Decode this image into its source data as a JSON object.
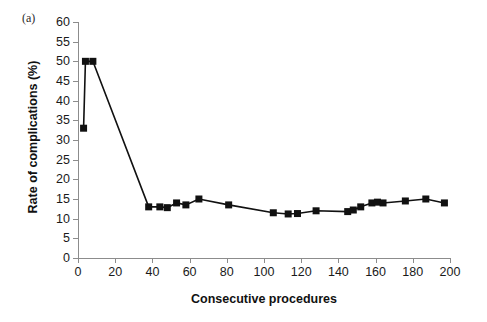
{
  "figure": {
    "panel_label": "(a)",
    "background_color": "#ffffff",
    "axis_color": "#8c8c8c",
    "series_color": "#111111"
  },
  "chart_data": {
    "type": "line",
    "title": "",
    "xlabel": "Consecutive procedures",
    "ylabel": "Rate of complications (%)",
    "xlim": [
      0,
      200
    ],
    "ylim": [
      0,
      60
    ],
    "xticks": [
      0,
      20,
      40,
      60,
      80,
      100,
      120,
      140,
      160,
      180,
      200
    ],
    "yticks": [
      0,
      5,
      10,
      15,
      20,
      25,
      30,
      35,
      40,
      45,
      50,
      55,
      60
    ],
    "xtick_labels": [
      "0",
      "20",
      "40",
      "60",
      "80",
      "100",
      "120",
      "140",
      "160",
      "180",
      "200"
    ],
    "ytick_labels": [
      "0",
      "5",
      "10",
      "15",
      "20",
      "25",
      "30",
      "35",
      "40",
      "45",
      "50",
      "55",
      "60"
    ],
    "grid": false,
    "legend": false,
    "marker": "square",
    "series": [
      {
        "name": "Rate of complications",
        "x": [
          3,
          4,
          8,
          38,
          44,
          48,
          53,
          58,
          65,
          81,
          105,
          113,
          118,
          128,
          145,
          148,
          152,
          158,
          161,
          164,
          176,
          187,
          197
        ],
        "y": [
          33,
          50,
          50,
          13,
          13,
          12.8,
          14,
          13.5,
          15,
          13.5,
          11.5,
          11.2,
          11.3,
          12,
          11.8,
          12.2,
          13,
          14,
          14.2,
          14,
          14.5,
          15,
          14
        ]
      }
    ]
  }
}
